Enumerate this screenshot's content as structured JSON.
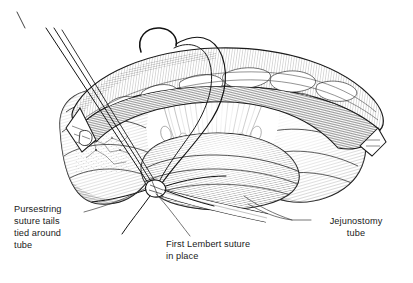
{
  "figure": {
    "style": "pen-and-ink medical line illustration",
    "background_color": "#ffffff",
    "ink_color": "#1a1a1a",
    "width": 413,
    "height": 283
  },
  "labels": [
    {
      "id": "pursestring",
      "text": "Pursestring\nsuture tails\ntied around\ntube",
      "align": "left"
    },
    {
      "id": "lembert",
      "text": "First Lembert suture\nin place",
      "align": "left"
    },
    {
      "id": "jejunostomy",
      "text": "Jejunostomy\ntube",
      "align": "center"
    }
  ],
  "anatomy": {
    "bowel_loop": "jejunal loop",
    "mesentery": "radiating mesenteric fan",
    "overlying_band": "omental / fatty band across superior aspect",
    "needle": "curved surgical needle with suture thread",
    "tube": "jejunostomy feeding tube",
    "knot": "pursestring suture knot at tube entry site"
  }
}
